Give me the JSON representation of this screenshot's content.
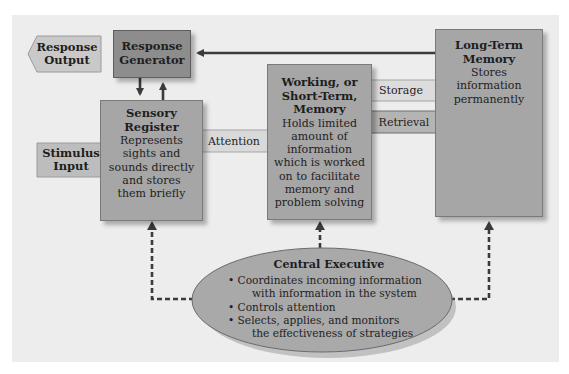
{
  "colors": {
    "panel_bg": "#ededed",
    "box_mid": "#a6a6a6",
    "box_dark": "#8d8d8d",
    "tag_light": "#d9d9d9",
    "tag_mid": "#b4b4b4",
    "arrow": "#3b3b3b"
  },
  "response_output": {
    "line1": "Response",
    "line2": "Output"
  },
  "response_generator": {
    "line1": "Response",
    "line2": "Generator"
  },
  "sensory_register": {
    "title1": "Sensory",
    "title2": "Register",
    "body": [
      "Represents",
      "sights and",
      "sounds directly",
      "and stores",
      "them briefly"
    ]
  },
  "stimulus_input": {
    "line1": "Stimulus",
    "line2": "Input"
  },
  "attention": {
    "label": "Attention"
  },
  "working_memory": {
    "title": [
      "Working, or",
      "Short-Term,",
      "Memory"
    ],
    "body": [
      "Holds limited",
      "amount of",
      "information",
      "which is worked",
      "on to facilitate",
      "memory and",
      "problem solving"
    ]
  },
  "storage": {
    "label": "Storage"
  },
  "retrieval": {
    "label": "Retrieval"
  },
  "long_term_memory": {
    "title": [
      "Long-Term",
      "Memory"
    ],
    "body": [
      "Stores",
      "information",
      "permanently"
    ]
  },
  "central_executive": {
    "title": "Central Executive",
    "bullets": [
      {
        "line1": "• Coordinates incoming information",
        "line2": "with information in the system"
      },
      {
        "line1": "• Controls attention"
      },
      {
        "line1": "• Selects, applies, and monitors",
        "line2": "the effectiveness of strategies"
      }
    ]
  }
}
